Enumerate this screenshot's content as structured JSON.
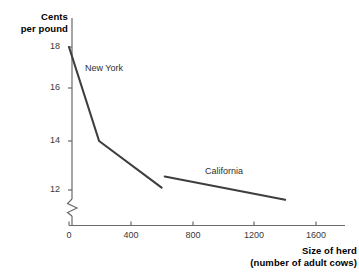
{
  "chart_data": {
    "type": "line",
    "title": "",
    "xlabel": "Size of herd",
    "xlabel_sub": "(number of adult cows)",
    "ylabel": "Cents",
    "ylabel_sub": "per pound",
    "xlim": [
      0,
      1760
    ],
    "ylim": [
      11.3,
      18.6
    ],
    "xticks": [
      0,
      400,
      800,
      1200,
      1600
    ],
    "xtick_labels": [
      "0",
      "400",
      "800",
      "1200",
      "1600"
    ],
    "yticks": [
      12,
      14,
      16,
      18
    ],
    "ytick_labels": [
      "12",
      "14",
      "16",
      "18"
    ],
    "grid": false,
    "legend": "inline-annotations",
    "axis_break": {
      "axis": "y",
      "symbol": "zigzag",
      "note": "y-axis broken below 12"
    },
    "series": [
      {
        "name": "New York",
        "points": [
          {
            "x": 0,
            "y": 18.0
          },
          {
            "x": 195,
            "y": 14.0
          },
          {
            "x": 600,
            "y": 12.1
          }
        ],
        "color": "#3e3e40",
        "label_x": 220,
        "label_y": 16.9
      },
      {
        "name": "California",
        "points": [
          {
            "x": 620,
            "y": 12.55
          },
          {
            "x": 1400,
            "y": 11.6
          }
        ],
        "color": "#3e3e40",
        "label_x": 900,
        "label_y": 12.65
      }
    ]
  },
  "style": {
    "axis_color": "#6a6a6c",
    "line_color": "#3e3e40",
    "tick_text_color": "#39393b",
    "title_text_color": "#000000",
    "background": "#ffffff"
  }
}
